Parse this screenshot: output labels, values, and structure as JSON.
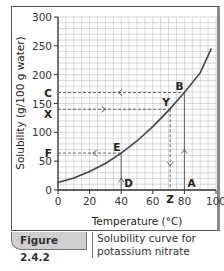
{
  "figure": {
    "number": "Figure 2.4.2",
    "caption": "Solubility curve for potassium nitrate"
  },
  "chart_data": {
    "type": "line",
    "title": "Solubility curve for potassium nitrate",
    "xlabel": "Temperature (°C)",
    "ylabel": "Solubility (g/100 g water)",
    "xlim": [
      0,
      100
    ],
    "ylim": [
      0,
      300
    ],
    "x_ticks": [
      0,
      20,
      40,
      60,
      80,
      100
    ],
    "y_ticks": [
      0,
      50,
      100,
      150,
      200,
      250,
      300
    ],
    "grid": true,
    "grid_minor": {
      "x_step": 5,
      "y_step": 10
    },
    "series": [
      {
        "name": "Potassium nitrate",
        "x": [
          0,
          10,
          20,
          30,
          40,
          50,
          60,
          70,
          80,
          90,
          97
        ],
        "y": [
          13,
          21,
          32,
          46,
          64,
          85,
          110,
          138,
          169,
          203,
          245
        ]
      }
    ],
    "annotations": [
      {
        "label": "A",
        "x": 80,
        "y": 0,
        "note": "arrow up to B"
      },
      {
        "label": "B",
        "x": 80,
        "y": 169
      },
      {
        "label": "C",
        "x": 0,
        "y": 169,
        "note": "dashed arrow from B to C"
      },
      {
        "label": "D",
        "x": 40,
        "y": 0,
        "note": "arrow up to E"
      },
      {
        "label": "E",
        "x": 40,
        "y": 64
      },
      {
        "label": "F",
        "x": 0,
        "y": 64,
        "note": "dashed arrow from E to F"
      },
      {
        "label": "X",
        "x": 0,
        "y": 140,
        "note": "dashed arrow from X to Y"
      },
      {
        "label": "Y",
        "x": 71,
        "y": 140
      },
      {
        "label": "Z",
        "x": 71,
        "y": 0,
        "note": "dashed arrow down from Y to Z"
      }
    ]
  }
}
